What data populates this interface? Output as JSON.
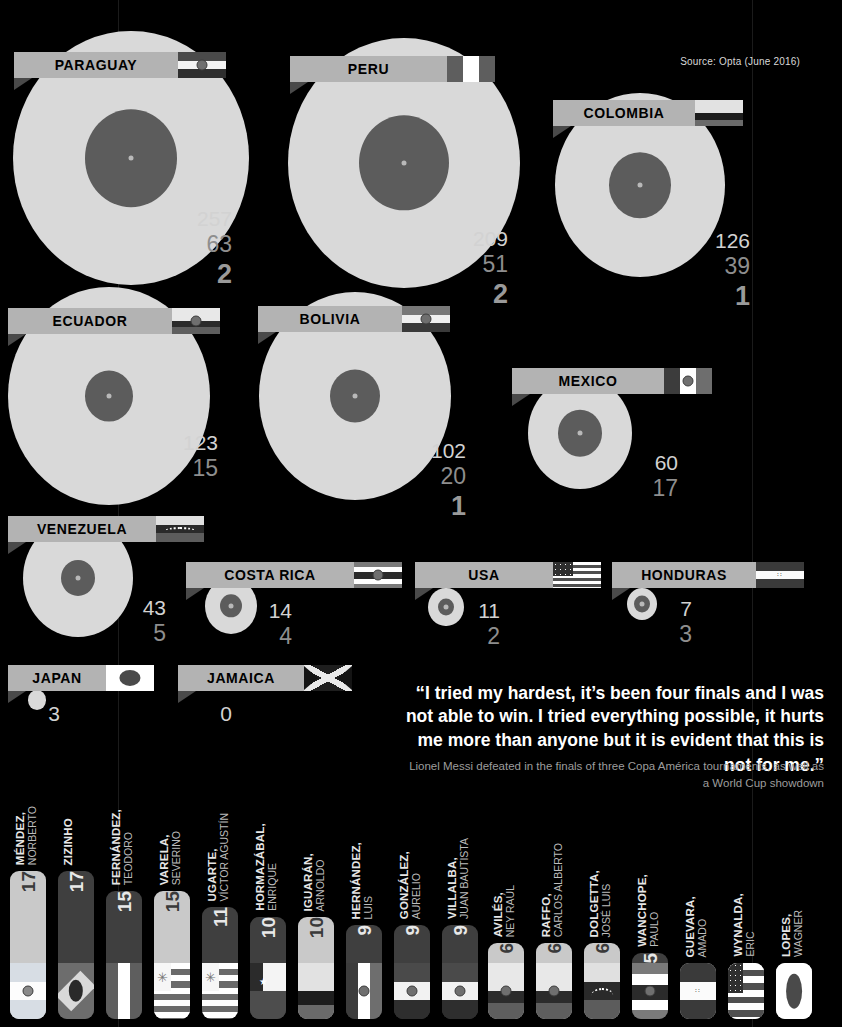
{
  "source_note": "Source: Opta (June 2016)",
  "colors": {
    "background": "#000000",
    "blob_outer": "#d9d9d9",
    "blob_inner": "#5c5c5c",
    "bar_label_bg": "#b3b3b3",
    "num_primary": "#d2d2d2",
    "num_secondary": "#8e8e8e",
    "num_tertiary": "#9a9a9a"
  },
  "chart_data": {
    "type": "bar",
    "xlabel": "",
    "ylabel": "",
    "grid": false,
    "legend": [
      "Matches played",
      "Wins / record figure",
      "Titles won"
    ],
    "categories": [
      "PARAGUAY",
      "PERU",
      "COLOMBIA",
      "ECUADOR",
      "BOLIVIA",
      "MEXICO",
      "VENEZUELA",
      "COSTA RICA",
      "USA",
      "HONDURAS",
      "JAPAN",
      "JAMAICA"
    ],
    "series": [
      {
        "name": "Matches played",
        "values": [
          257,
          209,
          126,
          123,
          102,
          60,
          43,
          14,
          11,
          7,
          3,
          0
        ]
      },
      {
        "name": "Wins",
        "values": [
          63,
          51,
          39,
          15,
          20,
          17,
          5,
          4,
          2,
          3,
          null,
          null
        ]
      },
      {
        "name": "Titles",
        "values": [
          2,
          2,
          1,
          null,
          1,
          null,
          null,
          null,
          null,
          null,
          null,
          null
        ]
      }
    ]
  },
  "countries": [
    {
      "name": "PARAGUAY",
      "flag": "paraguay",
      "n1": "257",
      "n2": "63",
      "n3": "2"
    },
    {
      "name": "PERU",
      "flag": "peru",
      "n1": "209",
      "n2": "51",
      "n3": "2"
    },
    {
      "name": "COLOMBIA",
      "flag": "colombia",
      "n1": "126",
      "n2": "39",
      "n3": "1"
    },
    {
      "name": "ECUADOR",
      "flag": "ecuador",
      "n1": "123",
      "n2": "15",
      "n3": ""
    },
    {
      "name": "BOLIVIA",
      "flag": "bolivia",
      "n1": "102",
      "n2": "20",
      "n3": "1"
    },
    {
      "name": "MEXICO",
      "flag": "mexico",
      "n1": "60",
      "n2": "17",
      "n3": ""
    },
    {
      "name": "VENEZUELA",
      "flag": "venezuela",
      "n1": "43",
      "n2": "5",
      "n3": ""
    },
    {
      "name": "COSTA RICA",
      "flag": "costarica",
      "n1": "14",
      "n2": "4",
      "n3": ""
    },
    {
      "name": "USA",
      "flag": "usa",
      "n1": "11",
      "n2": "2",
      "n3": ""
    },
    {
      "name": "HONDURAS",
      "flag": "honduras",
      "n1": "7",
      "n2": "3",
      "n3": ""
    },
    {
      "name": "JAPAN",
      "flag": "japan",
      "n1": "3",
      "n2": "",
      "n3": ""
    },
    {
      "name": "JAMAICA",
      "flag": "jamaica",
      "n1": "0",
      "n2": "",
      "n3": ""
    }
  ],
  "quote": {
    "open_mark": "“",
    "close_mark": "”",
    "text": "I tried my hardest, it’s been four finals and I was not able to win. I tried everything possible, it hurts me more than anyone but it is evident that this is not for me.",
    "attribution": "Lionel Messi defeated in the finals of three Copa América tournaments, as well as a World Cup showdown"
  },
  "players": [
    {
      "last": "MÉNDEZ,",
      "first": "NORBERTO",
      "goals": "17",
      "flag": "argentina"
    },
    {
      "last": "ZIZINHO",
      "first": "",
      "goals": "17",
      "flag": "brazil"
    },
    {
      "last": "FERNÁNDEZ,",
      "first": "TEODORO",
      "goals": "15",
      "flag": "peru"
    },
    {
      "last": "VARELA,",
      "first": "SEVERINO",
      "goals": "15",
      "flag": "uruguay"
    },
    {
      "last": "UGARTE,",
      "first": "VÍCTOR AGUSTÍN",
      "goals": "11",
      "flag": "uruguay"
    },
    {
      "last": "HORMAZÁBAL,",
      "first": "ENRIQUE",
      "goals": "10",
      "flag": "chile"
    },
    {
      "last": "IGUARÁN,",
      "first": "ARNOLDO",
      "goals": "10",
      "flag": "colombia"
    },
    {
      "last": "HERNÁNDEZ,",
      "first": "LUIS",
      "goals": "9",
      "flag": "mexico"
    },
    {
      "last": "GONZÁLEZ,",
      "first": "AURELIO",
      "goals": "9",
      "flag": "paraguay"
    },
    {
      "last": "VILLALBA,",
      "first": "JUAN BAUTISTA",
      "goals": "9",
      "flag": "paraguay"
    },
    {
      "last": "AVILÉS,",
      "first": "NEY RAÚL",
      "goals": "6",
      "flag": "ecuador"
    },
    {
      "last": "RAFFO,",
      "first": "CARLOS ALBERTO",
      "goals": "6",
      "flag": "ecuador"
    },
    {
      "last": "DOLGETTA,",
      "first": "JOSÉ LUIS",
      "goals": "6",
      "flag": "venezuela"
    },
    {
      "last": "WANCHOPE,",
      "first": "PAULO",
      "goals": "5",
      "flag": "costarica"
    },
    {
      "last": "GUEVARA,",
      "first": "AMADO",
      "goals": "3",
      "flag": "honduras"
    },
    {
      "last": "WYNALDA,",
      "first": "ERIC",
      "goals": "3",
      "flag": "usa"
    },
    {
      "last": "LOPES,",
      "first": "WAGNER",
      "goals": "2",
      "flag": "japan"
    }
  ]
}
